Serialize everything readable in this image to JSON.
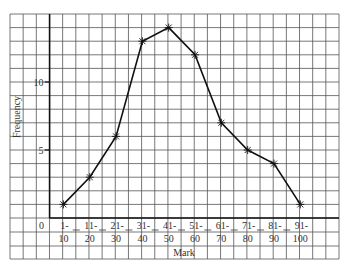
{
  "chart_data": {
    "type": "line",
    "title": "",
    "xlabel": "Mark",
    "ylabel": "Frequency",
    "categories": [
      "1-10",
      "11-20",
      "21-30",
      "31-40",
      "41-50",
      "51-60",
      "61-70",
      "71-80",
      "81-90",
      "91-100"
    ],
    "category_labels": [
      [
        "1-",
        "10"
      ],
      [
        "11-",
        "20"
      ],
      [
        "21-",
        "30"
      ],
      [
        "31-",
        "40"
      ],
      [
        "41-",
        "50"
      ],
      [
        "51-",
        "60"
      ],
      [
        "61-",
        "70"
      ],
      [
        "71-",
        "80"
      ],
      [
        "81-",
        "90"
      ],
      [
        "91-",
        "100"
      ]
    ],
    "series": [
      {
        "name": "Frequency",
        "values": [
          1,
          3,
          6,
          13,
          14,
          12,
          7,
          5,
          4,
          1
        ]
      }
    ],
    "values": [
      1,
      3,
      6,
      13,
      14,
      12,
      7,
      5,
      4,
      1
    ],
    "yticks": [
      5,
      10
    ],
    "origin_label": "0",
    "ylim": [
      0,
      15
    ],
    "grid": true,
    "marker": "asterisk",
    "legend": null
  },
  "colors": {
    "grid": "#555555",
    "axis": "#111111",
    "line": "#111111",
    "text": "#333333"
  }
}
